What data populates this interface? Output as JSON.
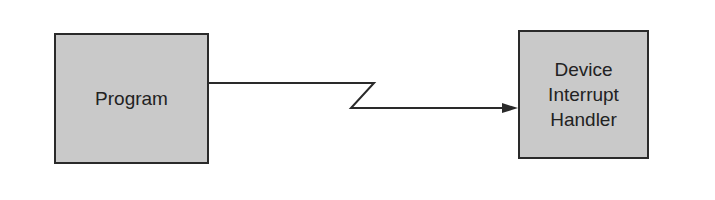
{
  "diagram": {
    "nodes": [
      {
        "id": "program",
        "label": "Program"
      },
      {
        "id": "handler",
        "lines": [
          "Device",
          "Interrupt",
          "Handler"
        ]
      }
    ],
    "edges": [
      {
        "from": "program",
        "to": "handler",
        "style": "lightning-break arrow"
      }
    ],
    "colors": {
      "box_fill": "#c9c9c9",
      "stroke": "#2a2a2a"
    }
  }
}
